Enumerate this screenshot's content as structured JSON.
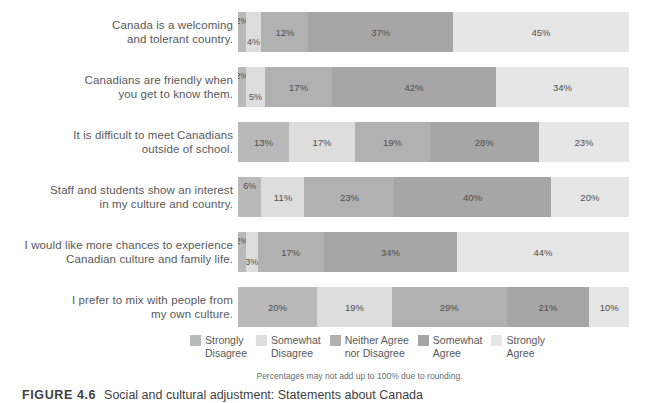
{
  "chart_data": {
    "type": "bar",
    "subtype": "100-percent-stacked-horizontal",
    "title": "",
    "xlabel": "",
    "ylabel": "",
    "xlim": [
      0,
      100
    ],
    "grid": false,
    "legend_position": "bottom",
    "categories": [
      "Canada is a welcoming and tolerant country.",
      "Canadians are friendly when you get to know them.",
      "It is difficult to meet Canadians outside of school.",
      "Staff and students show an interest in my culture and country.",
      "I would like more chances to experience Canadian culture and family life.",
      "I prefer to mix with people from my own culture."
    ],
    "series": [
      {
        "name": "Strongly Disagree",
        "color": "#b9b9b9",
        "values": [
          2,
          2,
          13,
          6,
          2,
          20
        ]
      },
      {
        "name": "Somewhat Disagree",
        "color": "#dddddd",
        "values": [
          4,
          5,
          17,
          11,
          3,
          19
        ]
      },
      {
        "name": "Neither Agree nor Disagree",
        "color": "#b1b1b1",
        "values": [
          12,
          17,
          19,
          23,
          17,
          29
        ]
      },
      {
        "name": "Somewhat Agree",
        "color": "#a6a6a6",
        "values": [
          37,
          42,
          28,
          40,
          34,
          21
        ]
      },
      {
        "name": "Strongly Agree",
        "color": "#e6e6e6",
        "values": [
          45,
          34,
          23,
          20,
          44,
          10
        ]
      }
    ],
    "value_label_suffix": "%",
    "footnote": "Percentages may not add up to 100% due to rounding."
  },
  "rows": [
    {
      "label_lines": [
        "Canada is a welcoming",
        "and tolerant country."
      ],
      "segments": [
        {
          "label": "2%",
          "value": 2,
          "series": "Strongly Disagree"
        },
        {
          "label": "4%",
          "value": 4,
          "series": "Somewhat Disagree"
        },
        {
          "label": "12%",
          "value": 12,
          "series": "Neither Agree nor Disagree"
        },
        {
          "label": "37%",
          "value": 37,
          "series": "Somewhat Agree"
        },
        {
          "label": "45%",
          "value": 45,
          "series": "Strongly Agree"
        }
      ]
    },
    {
      "label_lines": [
        "Canadians are friendly when",
        "you get to know them."
      ],
      "segments": [
        {
          "label": "2%",
          "value": 2,
          "series": "Strongly Disagree"
        },
        {
          "label": "5%",
          "value": 5,
          "series": "Somewhat Disagree"
        },
        {
          "label": "17%",
          "value": 17,
          "series": "Neither Agree nor Disagree"
        },
        {
          "label": "42%",
          "value": 42,
          "series": "Somewhat Agree"
        },
        {
          "label": "34%",
          "value": 34,
          "series": "Strongly Agree"
        }
      ]
    },
    {
      "label_lines": [
        "It is difficult to meet Canadians",
        "outside of school."
      ],
      "segments": [
        {
          "label": "13%",
          "value": 13,
          "series": "Strongly Disagree"
        },
        {
          "label": "17%",
          "value": 17,
          "series": "Somewhat Disagree"
        },
        {
          "label": "19%",
          "value": 19,
          "series": "Neither Agree nor Disagree"
        },
        {
          "label": "28%",
          "value": 28,
          "series": "Somewhat Agree"
        },
        {
          "label": "23%",
          "value": 23,
          "series": "Strongly Agree"
        }
      ]
    },
    {
      "label_lines": [
        "Staff and students show an interest",
        "in my culture and country."
      ],
      "segments": [
        {
          "label": "6%",
          "value": 6,
          "series": "Strongly Disagree"
        },
        {
          "label": "11%",
          "value": 11,
          "series": "Somewhat Disagree"
        },
        {
          "label": "23%",
          "value": 23,
          "series": "Neither Agree nor Disagree"
        },
        {
          "label": "40%",
          "value": 40,
          "series": "Somewhat Agree"
        },
        {
          "label": "20%",
          "value": 20,
          "series": "Strongly Agree"
        }
      ]
    },
    {
      "label_lines": [
        "I would like more chances to experience",
        "Canadian culture and family life."
      ],
      "segments": [
        {
          "label": "2%",
          "value": 2,
          "series": "Strongly Disagree"
        },
        {
          "label": "3%",
          "value": 3,
          "series": "Somewhat Disagree"
        },
        {
          "label": "17%",
          "value": 17,
          "series": "Neither Agree nor Disagree"
        },
        {
          "label": "34%",
          "value": 34,
          "series": "Somewhat Agree"
        },
        {
          "label": "44%",
          "value": 44,
          "series": "Strongly Agree"
        }
      ]
    },
    {
      "label_lines": [
        "I prefer to mix with people from",
        "my own culture."
      ],
      "segments": [
        {
          "label": "20%",
          "value": 20,
          "series": "Strongly Disagree"
        },
        {
          "label": "19%",
          "value": 19,
          "series": "Somewhat Disagree"
        },
        {
          "label": "29%",
          "value": 29,
          "series": "Neither Agree nor Disagree"
        },
        {
          "label": "21%",
          "value": 21,
          "series": "Somewhat Agree"
        },
        {
          "label": "10%",
          "value": 10,
          "series": "Strongly Agree"
        }
      ]
    }
  ],
  "legend": {
    "items": [
      {
        "lines": [
          "Strongly",
          "Disagree"
        ],
        "color": "#b9b9b9"
      },
      {
        "lines": [
          "Somewhat",
          "Disagree"
        ],
        "color": "#dddddd"
      },
      {
        "lines": [
          "Neither Agree",
          "nor Disagree"
        ],
        "color": "#b1b1b1"
      },
      {
        "lines": [
          "Somewhat",
          "Agree"
        ],
        "color": "#a6a6a6"
      },
      {
        "lines": [
          "Strongly",
          "Agree"
        ],
        "color": "#e6e6e6"
      }
    ]
  },
  "footnote": "Percentages may not add up to 100% due to rounding.",
  "caption": {
    "number": "FIGURE 4.6",
    "text": "Social and cultural adjustment: Statements about Canada"
  }
}
